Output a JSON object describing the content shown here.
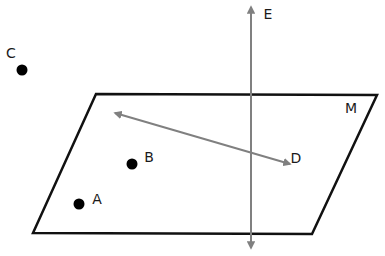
{
  "diagram": {
    "title": "",
    "colors": {
      "plane_stroke": "#111111",
      "point_fill": "#000000",
      "line_stroke": "#808080",
      "label": "#1a1a1a",
      "background": "#ffffff"
    },
    "plane": {
      "label": "M",
      "corners": [
        [
          96,
          94
        ],
        [
          377,
          95
        ],
        [
          312,
          234
        ],
        [
          33,
          233
        ]
      ],
      "label_pos": [
        351,
        108
      ]
    },
    "points": [
      {
        "id": "A",
        "label": "A",
        "x": 79,
        "y": 204,
        "label_pos": [
          97,
          199
        ],
        "on_plane": true
      },
      {
        "id": "B",
        "label": "B",
        "x": 132,
        "y": 164,
        "label_pos": [
          149,
          157
        ],
        "on_plane": true
      },
      {
        "id": "C",
        "label": "C",
        "x": 22,
        "y": 70,
        "label_pos": [
          11,
          53
        ],
        "on_plane": false
      }
    ],
    "lines": [
      {
        "id": "E",
        "label": "E",
        "type": "line",
        "from": [
          251,
          248
        ],
        "to": [
          251,
          7
        ],
        "arrows": "both",
        "label_pos": [
          268,
          14
        ],
        "relation": "intersects plane M"
      },
      {
        "id": "D",
        "label": "D",
        "type": "line",
        "from": [
          115,
          113
        ],
        "to": [
          290,
          164
        ],
        "arrows": "both",
        "label_pos": [
          296,
          158
        ],
        "relation": "lies in plane M"
      }
    ]
  }
}
